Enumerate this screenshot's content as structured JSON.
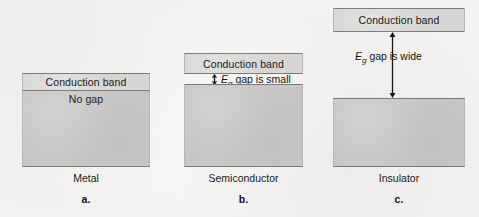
{
  "figure": {
    "type": "band-gap-diagram",
    "background_color": "#f3f2f0",
    "conduction_band_color": "#d7d6d4",
    "valence_band_color": "#c7c6c4",
    "border_color": "#7a7a78"
  },
  "panels": [
    {
      "id": "metal",
      "caption": "Metal",
      "letter": "a.",
      "conduction_band_label": "Conduction band",
      "valence_band_label": "No gap",
      "gap_label": null,
      "gap_symbol": null,
      "gap_descriptor": null,
      "has_gap": false,
      "arrow": "none"
    },
    {
      "id": "semiconductor",
      "caption": "Semiconductor",
      "letter": "b.",
      "conduction_band_label": "Conduction band",
      "valence_band_label": "",
      "gap_symbol": "E",
      "gap_subscript": "g",
      "gap_descriptor": " gap is small",
      "has_gap": true,
      "arrow": "double-headed-vertical-short"
    },
    {
      "id": "insulator",
      "caption": "Insulator",
      "letter": "c.",
      "conduction_band_label": "Conduction band",
      "valence_band_label": "",
      "gap_symbol": "E",
      "gap_subscript": "g",
      "gap_descriptor": " gap is wide",
      "has_gap": true,
      "arrow": "double-headed-vertical-long"
    }
  ]
}
